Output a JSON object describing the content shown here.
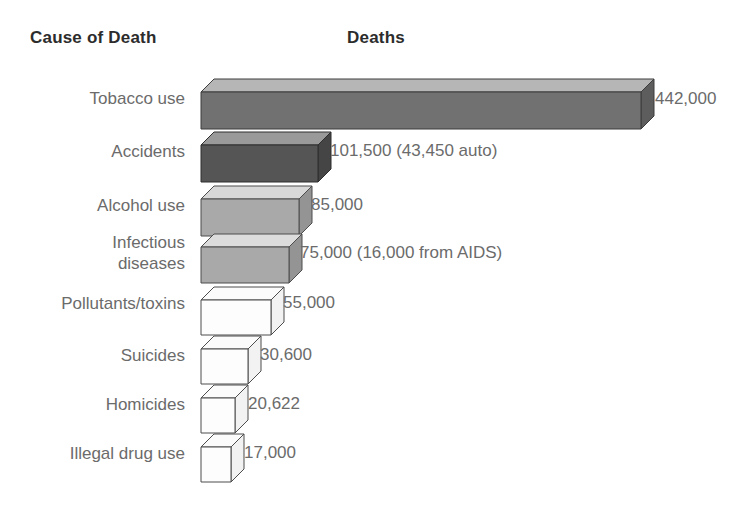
{
  "header": {
    "category_title": "Cause of Death",
    "value_title": "Deaths"
  },
  "chart_data": {
    "type": "bar",
    "title": "",
    "xlabel": "Deaths",
    "ylabel": "Cause of Death",
    "orientation": "horizontal",
    "grid": false,
    "legend": null,
    "style": "3d-blocks",
    "xlim": [
      0,
      442000
    ],
    "categories": [
      "Tobacco use",
      "Accidents",
      "Alcohol use",
      "Infectious diseases",
      "Pollutants/toxins",
      "Suicides",
      "Homicides",
      "Illegal drug use"
    ],
    "values": [
      442000,
      101500,
      85000,
      75000,
      55000,
      30600,
      20622,
      17000
    ],
    "value_labels": [
      "442,000",
      "101,500 (43,450 auto)",
      "85,000",
      "75,000 (16,000 from AIDS)",
      "55,000",
      "30,600",
      "20,622",
      "17,000"
    ],
    "annotations": [
      "43,450 of the 101,500 accident deaths were auto related",
      "16,000 of the 75,000 infectious disease deaths were from AIDS"
    ]
  },
  "rows": [
    {
      "label": "Tobacco use",
      "value": 442000,
      "value_label": "442,000",
      "face": "#717171",
      "top": "#b6b6b6",
      "side": "#5d5d5d",
      "stroke": "#3d3d3d",
      "top_y": 78,
      "bar_len": 440,
      "bar_h": 37,
      "label_y": 88,
      "label_lines": 1,
      "value_x": 655,
      "value_y": 89
    },
    {
      "label": "Accidents",
      "value": 101500,
      "value_label": "101,500 (43,450 auto)",
      "face": "#555555",
      "top": "#9a9a9a",
      "side": "#454545",
      "stroke": "#2f2f2f",
      "top_y": 131,
      "bar_len": 117,
      "bar_h": 37,
      "label_y": 141,
      "label_lines": 1,
      "value_x": 330,
      "value_y": 141
    },
    {
      "label": "Alcohol use",
      "value": 85000,
      "value_label": "85,000",
      "face": "#a9a9a9",
      "top": "#d8d8d8",
      "side": "#949494",
      "stroke": "#4d4d4d",
      "top_y": 185,
      "bar_len": 98,
      "bar_h": 37,
      "label_y": 195,
      "label_lines": 1,
      "value_x": 311,
      "value_y": 195
    },
    {
      "label": "Infectious\ndiseases",
      "value": 75000,
      "value_label": "75,000 (16,000 from AIDS)",
      "face": "#a9a9a9",
      "top": "#dcdcdc",
      "side": "#949494",
      "stroke": "#4d4d4d",
      "top_y": 233,
      "bar_len": 88,
      "bar_h": 36,
      "label_y": 232,
      "label_lines": 2,
      "value_x": 300,
      "value_y": 243
    },
    {
      "label": "Pollutants/toxins",
      "value": 55000,
      "value_label": "55,000",
      "face": "#fdfdfd",
      "top": "#fbfbfb",
      "side": "#f2f2f2",
      "stroke": "#4d4d4d",
      "top_y": 286,
      "bar_len": 70,
      "bar_h": 35,
      "label_y": 293,
      "label_lines": 1,
      "value_x": 283,
      "value_y": 293
    },
    {
      "label": "Suicides",
      "value": 30600,
      "value_label": "30,600",
      "face": "#fdfdfd",
      "top": "#fbfbfb",
      "side": "#f2f2f2",
      "stroke": "#4d4d4d",
      "top_y": 335,
      "bar_len": 47,
      "bar_h": 35,
      "label_y": 345,
      "label_lines": 1,
      "value_x": 260,
      "value_y": 345
    },
    {
      "label": "Homicides",
      "value": 20622,
      "value_label": "20,622",
      "face": "#fdfdfd",
      "top": "#fbfbfb",
      "side": "#f2f2f2",
      "stroke": "#4d4d4d",
      "top_y": 384,
      "bar_len": 34,
      "bar_h": 35,
      "label_y": 394,
      "label_lines": 1,
      "value_x": 248,
      "value_y": 394
    },
    {
      "label": "Illegal drug use",
      "value": 17000,
      "value_label": "17,000",
      "face": "#fdfdfd",
      "top": "#fbfbfb",
      "side": "#f2f2f2",
      "stroke": "#4d4d4d",
      "top_y": 433,
      "bar_len": 30,
      "bar_h": 35,
      "label_y": 443,
      "label_lines": 1,
      "value_x": 244,
      "value_y": 443
    }
  ],
  "colors": {
    "background": "#ffffff",
    "header_text": "#2c2c2c",
    "label_text": "#6b6b6b",
    "outline": "#4d4d4d"
  }
}
